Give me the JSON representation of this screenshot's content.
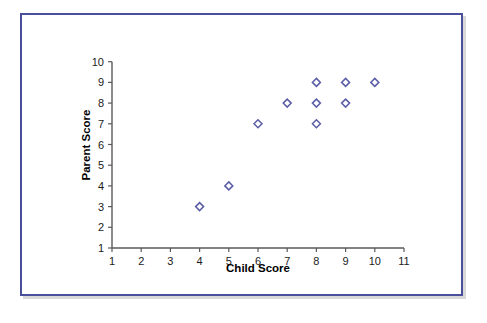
{
  "chart_data": {
    "type": "scatter",
    "title": "",
    "xlabel": "Child Score",
    "ylabel": "Parent Score",
    "xlim": [
      1,
      11
    ],
    "ylim": [
      1,
      10
    ],
    "xticks": [
      "1",
      "2",
      "3",
      "4",
      "5",
      "6",
      "7",
      "8",
      "9",
      "10",
      "11"
    ],
    "yticks": [
      "1",
      "2",
      "3",
      "4",
      "5",
      "6",
      "7",
      "8",
      "9",
      "10"
    ],
    "grid": false,
    "legend": null,
    "marker_style": "open-diamond",
    "marker_color": "#5b5ea6",
    "points": [
      {
        "x": 4,
        "y": 3
      },
      {
        "x": 5,
        "y": 4
      },
      {
        "x": 6,
        "y": 7
      },
      {
        "x": 7,
        "y": 8
      },
      {
        "x": 8,
        "y": 7
      },
      {
        "x": 8,
        "y": 8
      },
      {
        "x": 8,
        "y": 9
      },
      {
        "x": 9,
        "y": 8
      },
      {
        "x": 9,
        "y": 9
      },
      {
        "x": 10,
        "y": 9
      }
    ]
  },
  "frame": {
    "border_color": "#4a4f9c",
    "background": "#ffffff"
  }
}
